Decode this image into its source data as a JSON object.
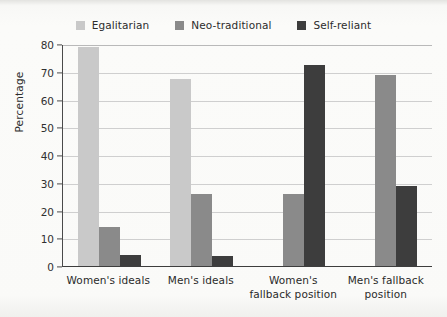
{
  "chart_data": {
    "type": "bar",
    "title": "",
    "subtitle": "",
    "xlabel": "",
    "ylabel": "Percentage",
    "ylim": [
      0,
      80
    ],
    "yticks": [
      0,
      10,
      20,
      30,
      40,
      50,
      60,
      70,
      80
    ],
    "ytick_labels": [
      "0",
      "10",
      "20",
      "30",
      "40",
      "50",
      "60",
      "70",
      "80"
    ],
    "grid": true,
    "legend_position": "top-center",
    "categories": [
      "Women's ideals",
      "Men's ideals",
      "Women's fallback position",
      "Men's fallback position"
    ],
    "category_lines": [
      [
        "Women's ideals"
      ],
      [
        "Men's ideals"
      ],
      [
        "Women's",
        "fallback position"
      ],
      [
        "Men's fallback",
        "position"
      ]
    ],
    "series": [
      {
        "name": "Egalitarian",
        "color": "#c9c9c9",
        "values": [
          79,
          67.5,
          null,
          null
        ]
      },
      {
        "name": "Neo-traditional",
        "color": "#8a8a8a",
        "values": [
          14,
          26,
          26,
          69
        ]
      },
      {
        "name": "Self-reliant",
        "color": "#3d3d3d",
        "values": [
          4,
          3.5,
          72.5,
          29
        ]
      }
    ]
  },
  "legend": {
    "items": [
      {
        "label": "Egalitarian",
        "color": "#c9c9c9"
      },
      {
        "label": "Neo-traditional",
        "color": "#8a8a8a"
      },
      {
        "label": "Self-reliant",
        "color": "#3d3d3d"
      }
    ]
  },
  "axes": {
    "y_title": "Percentage"
  }
}
